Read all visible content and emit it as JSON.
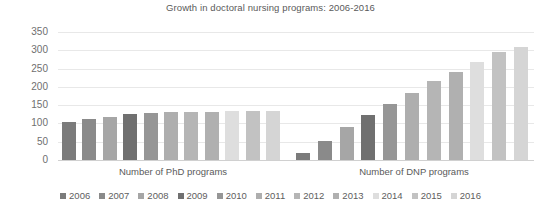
{
  "chart_data": {
    "type": "bar",
    "title": "Growth in doctoral nursing programs: 2006-2016",
    "xlabel": "",
    "ylabel": "",
    "ylim": [
      0,
      350
    ],
    "yticks": [
      0,
      50,
      100,
      150,
      200,
      250,
      300,
      350
    ],
    "grid": true,
    "legend_position": "bottom",
    "categories": [
      "Number of PhD programs",
      "Number of DNP programs"
    ],
    "series": [
      {
        "name": "2006",
        "color": "#7b7b7b",
        "values": [
          103,
          20
        ]
      },
      {
        "name": "2007",
        "color": "#8a8a8a",
        "values": [
          112,
          53
        ]
      },
      {
        "name": "2008",
        "color": "#a6a6a6",
        "values": [
          118,
          90
        ]
      },
      {
        "name": "2009",
        "color": "#707070",
        "values": [
          125,
          122
        ]
      },
      {
        "name": "2010",
        "color": "#969696",
        "values": [
          128,
          153
        ]
      },
      {
        "name": "2011",
        "color": "#aeaeae",
        "values": [
          130,
          184
        ]
      },
      {
        "name": "2012",
        "color": "#b5b5b5",
        "values": [
          131,
          217
        ]
      },
      {
        "name": "2013",
        "color": "#b0b0b0",
        "values": [
          132,
          241
        ]
      },
      {
        "name": "2014",
        "color": "#dedede",
        "values": [
          133,
          268
        ]
      },
      {
        "name": "2015",
        "color": "#c2c2c2",
        "values": [
          134,
          296
        ]
      },
      {
        "name": "2016",
        "color": "#d5d5d5",
        "values": [
          135,
          310
        ]
      }
    ]
  }
}
